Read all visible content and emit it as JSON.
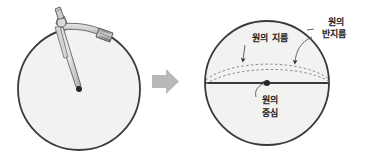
{
  "figure": {
    "type": "diagram",
    "background_color": "#ffffff"
  },
  "colors": {
    "circle_fill": "#f2f2f0",
    "circle_stroke": "#3a3a3a",
    "compass_body": "#d8d8d6",
    "compass_stroke": "#6e6e6e",
    "compass_grip_dark": "#7a7a7a",
    "arrow_fill": "#b8b8b8",
    "label_text": "#1c1c1c",
    "dashed_curve": "#8a8a8a",
    "diameter_line": "#3a3a3a",
    "leader_line": "#555555"
  },
  "left_panel": {
    "name": "compass-drawing-circle",
    "circle": {
      "center_x": 79,
      "center_y": 89,
      "radius": 61
    },
    "center_dot": {
      "x": 79,
      "y": 89,
      "radius": 3
    },
    "compass": {
      "name": "drafting-compass",
      "pivot_x": 60,
      "pivot_y": 26,
      "needle_tip_x": 79,
      "needle_tip_y": 89,
      "pencil_tip_x": 108,
      "pencil_tip_y": 38
    }
  },
  "middle_panel": {
    "arrow": {
      "name": "right-arrow-icon",
      "direction": "right",
      "x": 152,
      "y": 81
    }
  },
  "right_panel": {
    "name": "labeled-circle",
    "circle": {
      "center_x": 267,
      "center_y": 83,
      "radius": 62
    },
    "center_dot": {
      "x": 267,
      "y": 83,
      "radius": 3
    },
    "labels": [
      {
        "id": "diameter",
        "name": "label-diameter",
        "lines": [
          "원의 지름"
        ],
        "x": 270,
        "y": 41,
        "anchor": "middle"
      },
      {
        "id": "radius",
        "name": "label-radius",
        "lines": [
          "원의",
          "반지름"
        ],
        "x": 334,
        "y": 26,
        "anchor": "middle"
      },
      {
        "id": "center",
        "name": "label-center",
        "lines": [
          "원의",
          "중심"
        ],
        "x": 270,
        "y": 101,
        "anchor": "middle"
      }
    ]
  }
}
